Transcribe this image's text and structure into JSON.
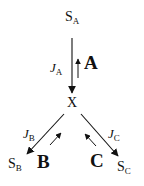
{
  "diagram": {
    "type": "metabolic-branch-point",
    "nodes": {
      "source": {
        "label": "S",
        "sub": "A"
      },
      "branch": {
        "label": "X"
      },
      "sink_b": {
        "label": "S",
        "sub": "B"
      },
      "sink_c": {
        "label": "S",
        "sub": "C"
      }
    },
    "fluxes": {
      "a": {
        "label": "J",
        "sub": "A"
      },
      "b": {
        "label": "J",
        "sub": "B"
      },
      "c": {
        "label": "J",
        "sub": "C"
      }
    },
    "enzymes": {
      "a": "A",
      "b": "B",
      "c": "C"
    },
    "edges": [
      {
        "from": "S_A",
        "to": "X",
        "flux": "J_A",
        "enzyme": "A"
      },
      {
        "from": "X",
        "to": "S_B",
        "flux": "J_B",
        "enzyme": "B"
      },
      {
        "from": "X",
        "to": "S_C",
        "flux": "J_C",
        "enzyme": "C"
      }
    ],
    "colors": {
      "ink": "#111111",
      "background": "#ffffff"
    }
  }
}
